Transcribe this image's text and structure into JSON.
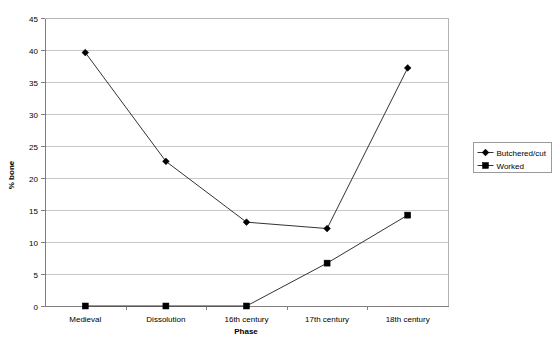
{
  "chart_data": {
    "type": "line",
    "title": "",
    "xlabel": "Phase",
    "ylabel": "% bone",
    "categories": [
      "Medieval",
      "Dissolution",
      "16th century",
      "17th century",
      "18th century"
    ],
    "series": [
      {
        "name": "Butchered/cut",
        "marker": "diamond",
        "values": [
          39.6,
          22.6,
          13.1,
          12.1,
          37.2
        ]
      },
      {
        "name": "Worked",
        "marker": "square",
        "values": [
          0.0,
          0.0,
          0.0,
          6.7,
          14.2
        ]
      }
    ],
    "ylim": [
      0,
      45
    ],
    "ytick_step": 5,
    "yticks": [
      "0",
      "5",
      "10",
      "15",
      "20",
      "25",
      "30",
      "35",
      "40",
      "45"
    ],
    "grid": "horizontal",
    "legend_position": "right",
    "colors": {
      "series_line": "#333333",
      "marker": "#000000",
      "gridline": "#c8c8c8",
      "frame": "#b4b4b4",
      "background": "#ffffff"
    }
  }
}
